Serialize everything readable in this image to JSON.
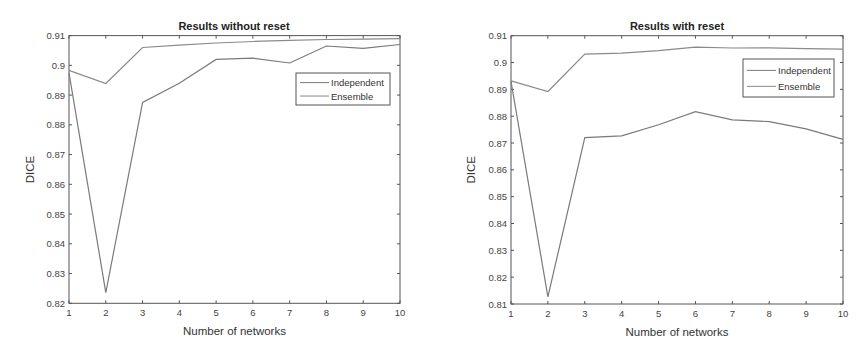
{
  "colors": {
    "axis": "#555555",
    "independent": "#7a7a7a",
    "ensemble": "#8a8a8a",
    "legend_border": "#555555"
  },
  "chart_data": [
    {
      "type": "line",
      "title": "Results without reset",
      "xlabel": "Number of networks",
      "ylabel": "DICE",
      "x": [
        1,
        2,
        3,
        4,
        5,
        6,
        7,
        8,
        9,
        10
      ],
      "xlim": [
        1,
        10
      ],
      "ylim": [
        0.82,
        0.91
      ],
      "xticks": [
        "1",
        "2",
        "3",
        "4",
        "5",
        "6",
        "7",
        "8",
        "9",
        "10"
      ],
      "yticks": [
        "0.82",
        "0.83",
        "0.84",
        "0.85",
        "0.86",
        "0.87",
        "0.88",
        "0.89",
        "0.9",
        "0.91"
      ],
      "grid": false,
      "legend_position": "upper right (inside)",
      "series": [
        {
          "name": "Independent",
          "values": [
            0.8975,
            0.8236,
            0.8875,
            0.894,
            0.902,
            0.9024,
            0.9008,
            0.9065,
            0.9057,
            0.907
          ]
        },
        {
          "name": "Ensemble",
          "values": [
            0.8983,
            0.8939,
            0.906,
            0.9068,
            0.9075,
            0.908,
            0.9084,
            0.9087,
            0.9088,
            0.909
          ]
        }
      ]
    },
    {
      "type": "line",
      "title": "Results with reset",
      "xlabel": "Number of networks",
      "ylabel": "DICE",
      "x": [
        1,
        2,
        3,
        4,
        5,
        6,
        7,
        8,
        9,
        10
      ],
      "xlim": [
        1,
        10
      ],
      "ylim": [
        0.81,
        0.91
      ],
      "xticks": [
        "1",
        "2",
        "3",
        "4",
        "5",
        "6",
        "7",
        "8",
        "9",
        "10"
      ],
      "yticks": [
        "0.81",
        "0.82",
        "0.83",
        "0.84",
        "0.85",
        "0.86",
        "0.87",
        "0.88",
        "0.89",
        "0.9",
        "0.91"
      ],
      "grid": false,
      "legend_position": "upper right (inside)",
      "series": [
        {
          "name": "Independent",
          "values": [
            0.893,
            0.8127,
            0.872,
            0.8727,
            0.8768,
            0.8817,
            0.8786,
            0.878,
            0.8753,
            0.8714
          ]
        },
        {
          "name": "Ensemble",
          "values": [
            0.8932,
            0.8892,
            0.9031,
            0.9035,
            0.9044,
            0.9057,
            0.9054,
            0.9055,
            0.9052,
            0.905
          ]
        }
      ]
    }
  ],
  "layout": [
    {
      "plot": {
        "left": 69,
        "top": 35.6,
        "right": 400,
        "bottom": 303.3
      },
      "legend": {
        "left": 296,
        "top": 73,
        "width": 94,
        "height": 32
      },
      "title_x": 234,
      "title_y": 30,
      "ylabel_x": 34
    },
    {
      "plot": {
        "left": 74,
        "top": 35.7,
        "right": 406,
        "bottom": 304
      },
      "legend": {
        "left": 306,
        "top": 59,
        "width": 91,
        "height": 38
      },
      "title_x": 240,
      "title_y": 30,
      "ylabel_x": 38
    }
  ]
}
